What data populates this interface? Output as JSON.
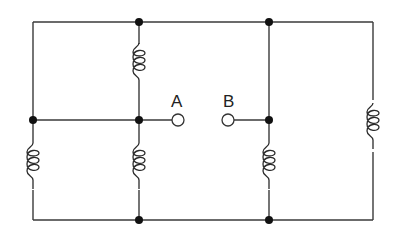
{
  "diagram": {
    "type": "circuit",
    "terminals": [
      {
        "id": "A",
        "label": "A"
      },
      {
        "id": "B",
        "label": "B"
      }
    ],
    "components": [
      {
        "type": "inductor",
        "position": "top-middle"
      },
      {
        "type": "inductor",
        "position": "bottom-left"
      },
      {
        "type": "inductor",
        "position": "bottom-middle"
      },
      {
        "type": "inductor",
        "position": "bottom-right-inner"
      },
      {
        "type": "inductor",
        "position": "far-right"
      }
    ],
    "colors": {
      "wire": "#3a3a3a",
      "node": "#111111",
      "background": "#ffffff"
    }
  }
}
